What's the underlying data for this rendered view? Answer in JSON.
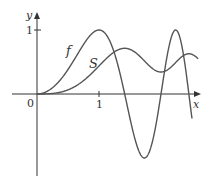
{
  "chart_data": {
    "type": "line",
    "title": "",
    "xlabel": "x",
    "ylabel": "y",
    "x_ticks": [
      "0",
      "1"
    ],
    "y_ticks": [
      "1"
    ],
    "xlim": [
      0,
      2.6
    ],
    "ylim": [
      -1.35,
      1.25
    ],
    "grid": false,
    "legend": "inline curve labels",
    "series": [
      {
        "name": "f",
        "description": "f(x) = sin(pi x^2 / 2)",
        "x": [
          0,
          0.25,
          0.5,
          0.75,
          1.0,
          1.25,
          1.5,
          1.732,
          2.0,
          2.236,
          2.5
        ],
        "y": [
          0,
          0.098,
          0.383,
          0.773,
          1.0,
          0.634,
          -0.383,
          -1.0,
          0.0,
          1.0,
          -0.383
        ]
      },
      {
        "name": "S",
        "description": "S(x) = integral from 0 to x of sin(pi t^2 / 2) dt (Fresnel integral)",
        "x": [
          0,
          0.25,
          0.5,
          0.75,
          1.0,
          1.25,
          1.414,
          1.75,
          2.0,
          2.236,
          2.5
        ],
        "y": [
          0,
          0.008,
          0.065,
          0.209,
          0.438,
          0.623,
          0.714,
          0.532,
          0.343,
          0.619,
          0.619
        ]
      }
    ]
  },
  "labels": {
    "origin": "0",
    "x_tick": "1",
    "y_tick": "1",
    "x_axis": "x",
    "y_axis": "y",
    "curve_f": "f",
    "curve_s": "S"
  },
  "colors": {
    "axis": "#333333",
    "curve": "#555555"
  }
}
